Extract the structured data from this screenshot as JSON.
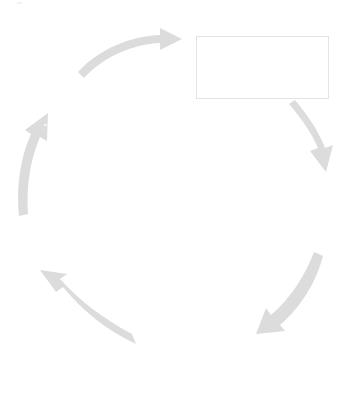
{
  "diagram": {
    "type": "cycle",
    "title": "",
    "direction": "clockwise",
    "canvas": {
      "width": 354,
      "height": 396,
      "background": "#ffffff"
    },
    "colors": {
      "arrow_fill": "#dcdcdc",
      "arrow_fill_light": "#e0e0e0",
      "box_border": "#e3e3e3",
      "box_fill": "#ffffff",
      "text": "#d9d9d9"
    },
    "label_boxes": [
      {
        "name": "cycle-label-box",
        "text": "",
        "x": 196,
        "y": 36,
        "width": 133,
        "height": 63
      }
    ],
    "arrows": [
      {
        "name": "arrow-top",
        "position": "top",
        "label": "",
        "direction": "left-to-right",
        "head": "right",
        "tip_x": 180,
        "tip_y": 38
      },
      {
        "name": "arrow-upper-right",
        "position": "upper-right",
        "label": "",
        "direction": "down-right",
        "head": "down",
        "tip_x": 325,
        "tip_y": 172
      },
      {
        "name": "arrow-lower-right",
        "position": "lower-right",
        "label": "",
        "direction": "down-left",
        "head": "down-left",
        "tip_x": 254,
        "tip_y": 333
      },
      {
        "name": "arrow-bottom-left",
        "position": "bottom-left",
        "label": "",
        "direction": "up-left",
        "head": "up-left",
        "tip_x": 40,
        "tip_y": 272
      },
      {
        "name": "arrow-left",
        "position": "left",
        "label": "",
        "direction": "up",
        "head": "up",
        "tip_x": 36,
        "tip_y": 113
      }
    ],
    "center": {
      "label": "",
      "x": 170,
      "y": 195
    }
  }
}
